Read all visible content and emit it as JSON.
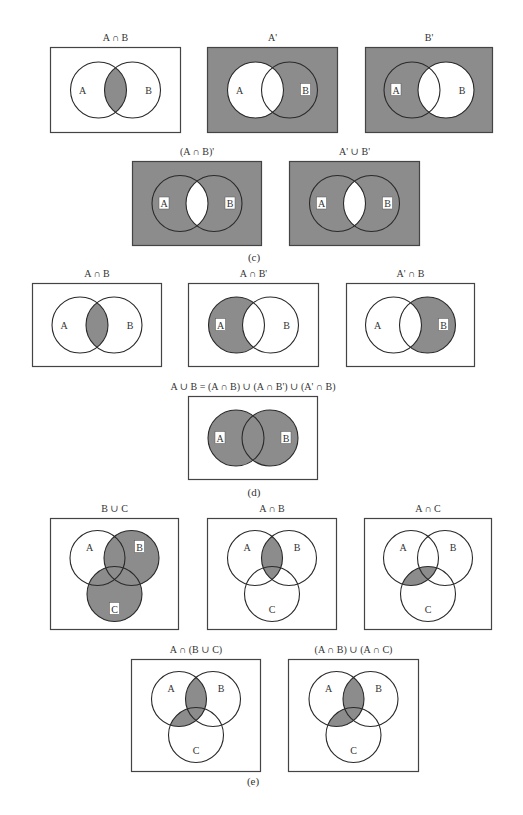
{
  "colors": {
    "shade": "#8c8c8c",
    "stroke": "#2a2a2a",
    "white": "#ffffff"
  },
  "captions": {
    "c": "(c)",
    "d": "(d)",
    "e": "(e)"
  },
  "diagrams": [
    {
      "title": "A ∩ B",
      "x": 50,
      "y": 47,
      "w": 131,
      "h": 86,
      "bg": false,
      "type": "two",
      "shade": "AB"
    },
    {
      "title": "A'",
      "x": 207,
      "y": 47,
      "w": 131,
      "h": 86,
      "bg": true,
      "type": "two",
      "shade": "B-only"
    },
    {
      "title": "B'",
      "x": 365,
      "y": 47,
      "w": 128,
      "h": 86,
      "bg": true,
      "type": "two",
      "shade": "A-only"
    },
    {
      "title": "(A ∩ B)'",
      "x": 132,
      "y": 161,
      "w": 130,
      "h": 85,
      "bg": true,
      "type": "two",
      "shade": "AorB-not-AB"
    },
    {
      "title": "A' ∪ B'",
      "x": 289,
      "y": 161,
      "w": 131,
      "h": 85,
      "bg": true,
      "type": "two",
      "shade": "AorB-not-AB"
    },
    {
      "title": "A ∩ B",
      "x": 32,
      "y": 283,
      "w": 130,
      "h": 84,
      "bg": false,
      "type": "two",
      "shade": "AB"
    },
    {
      "title": "A ∩ B'",
      "x": 188,
      "y": 283,
      "w": 131,
      "h": 84,
      "bg": false,
      "type": "two",
      "shade": "A-only"
    },
    {
      "title": "A' ∩ B",
      "x": 346,
      "y": 283,
      "w": 129,
      "h": 84,
      "bg": false,
      "type": "two",
      "shade": "B-only"
    },
    {
      "title": "A ∪ B = (A ∩ B) ∪ (A ∩ B') ∪ (A' ∩ B)",
      "x": 188,
      "y": 396,
      "w": 130,
      "h": 84,
      "bg": false,
      "type": "two",
      "shade": "AorB"
    },
    {
      "title": "B ∪ C",
      "x": 50,
      "y": 518,
      "w": 129,
      "h": 112,
      "bg": false,
      "type": "three",
      "shade": "BorC"
    },
    {
      "title": "A ∩ B",
      "x": 207,
      "y": 518,
      "w": 130,
      "h": 112,
      "bg": false,
      "type": "three",
      "shade": "AB"
    },
    {
      "title": "A ∩ C",
      "x": 364,
      "y": 518,
      "w": 128,
      "h": 112,
      "bg": false,
      "type": "three",
      "shade": "AC"
    },
    {
      "title": "A ∩ (B ∪ C)",
      "x": 131,
      "y": 659,
      "w": 130,
      "h": 113,
      "bg": false,
      "type": "three",
      "shade": "A-BorC"
    },
    {
      "title": "(A ∩ B) ∪ (A ∩ C)",
      "x": 288,
      "y": 659,
      "w": 131,
      "h": 113,
      "bg": false,
      "type": "three",
      "shade": "A-BorC"
    }
  ],
  "labels": {
    "a": "A",
    "b": "B",
    "c": "C"
  }
}
